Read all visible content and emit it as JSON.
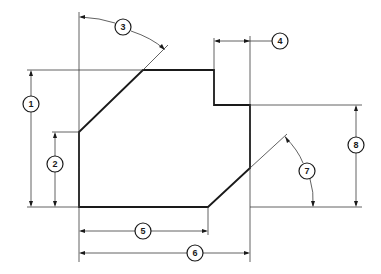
{
  "diagram": {
    "type": "technical-dimension-drawing",
    "callouts": [
      {
        "id": "1",
        "label": "1",
        "kind": "linear-vertical",
        "meaning": "overall height (bottom to top edge)"
      },
      {
        "id": "2",
        "label": "2",
        "kind": "linear-vertical",
        "meaning": "height of lower-left vertical edge"
      },
      {
        "id": "3",
        "label": "3",
        "kind": "angular",
        "meaning": "angle of upper-left chamfer from vertical"
      },
      {
        "id": "4",
        "label": "4",
        "kind": "linear-horizontal",
        "meaning": "width of notch step"
      },
      {
        "id": "5",
        "label": "5",
        "kind": "linear-horizontal",
        "meaning": "length of bottom edge"
      },
      {
        "id": "6",
        "label": "6",
        "kind": "linear-horizontal",
        "meaning": "overall width"
      },
      {
        "id": "7",
        "label": "7",
        "kind": "angular",
        "meaning": "angle of lower-right chamfer from horizontal"
      },
      {
        "id": "8",
        "label": "8",
        "kind": "linear-vertical",
        "meaning": "height of right edge below step"
      }
    ],
    "colors": {
      "line": "#1a1a1a",
      "background": "#ffffff"
    }
  }
}
